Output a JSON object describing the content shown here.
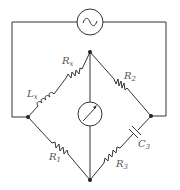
{
  "diagram": {
    "type": "AC bridge circuit (Maxwell-type inductance bridge)",
    "source": {
      "icon": "ac-source-icon",
      "symbol": "~"
    },
    "detector": {
      "icon": "galvanometer-icon"
    },
    "components": [
      {
        "id": "Lx",
        "kind": "inductor",
        "label": "L",
        "sub": "x"
      },
      {
        "id": "Rx",
        "kind": "resistor",
        "label": "R",
        "sub": "x"
      },
      {
        "id": "R2",
        "kind": "resistor",
        "label": "R",
        "sub": "2"
      },
      {
        "id": "R1",
        "kind": "resistor",
        "label": "R",
        "sub": "1"
      },
      {
        "id": "R3",
        "kind": "resistor",
        "label": "R",
        "sub": "3"
      },
      {
        "id": "C3",
        "kind": "capacitor",
        "label": "C",
        "sub": "3"
      }
    ]
  }
}
